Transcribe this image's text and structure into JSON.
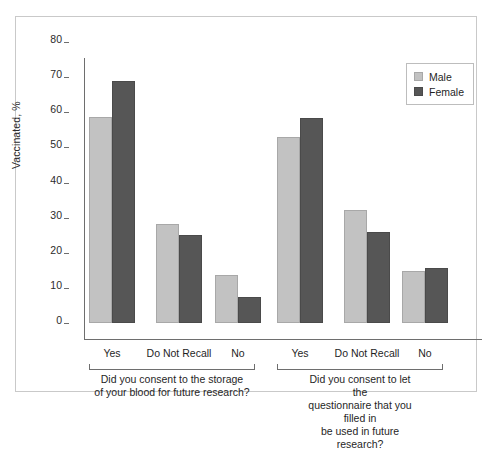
{
  "chart_data": {
    "type": "bar",
    "title": "",
    "xlabel": "",
    "ylabel": "Vaccinated, %",
    "ylim": [
      0,
      80
    ],
    "yticks": [
      0,
      10,
      20,
      30,
      40,
      50,
      60,
      70,
      80
    ],
    "ytick_labels": [
      "0",
      "10",
      "20",
      "30",
      "40",
      "50",
      "60",
      "70",
      "80"
    ],
    "grid": false,
    "legend_position": "top-right",
    "categories": [
      "Yes",
      "Do Not Recall",
      "No",
      "Yes",
      "Do Not Recall",
      "No"
    ],
    "series": [
      {
        "name": "Male",
        "color": "#c2c2c2",
        "values": [
          58.6,
          28.2,
          13.7,
          53.0,
          32.2,
          14.8
        ]
      },
      {
        "name": "Female",
        "color": "#565656",
        "values": [
          68.8,
          25.1,
          7.4,
          58.4,
          26.0,
          15.8
        ]
      }
    ],
    "groups": [
      {
        "caption_lines": [
          "Did you consent to the storage",
          "of your blood for future research?"
        ],
        "categories": [
          "Yes",
          "Do Not Recall",
          "No"
        ]
      },
      {
        "caption_lines": [
          "Did you consent to let the",
          "questionnaire that you filled in",
          "be used in future research?"
        ],
        "categories": [
          "Yes",
          "Do Not Recall",
          "No"
        ]
      }
    ]
  },
  "legend": {
    "items": [
      {
        "label": "Male",
        "swatch": "male-swatch"
      },
      {
        "label": "Female",
        "swatch": "female-swatch"
      }
    ]
  }
}
